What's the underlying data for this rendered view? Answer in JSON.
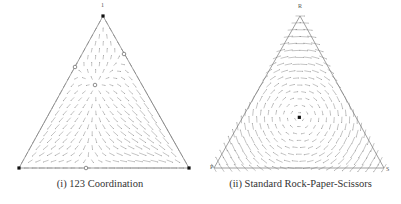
{
  "chart_data": [
    {
      "type": "vector-field-simplex",
      "title": "(i) 123 Coordination",
      "vertices": [
        "1",
        "2",
        "3"
      ],
      "vertex_labels_visible": [
        "1"
      ],
      "stable_points": [
        {
          "label": "vertex-top",
          "type": "filled"
        },
        {
          "label": "vertex-bottom-left",
          "type": "filled"
        },
        {
          "label": "vertex-bottom-right",
          "type": "filled"
        }
      ],
      "unstable_points": [
        {
          "label": "left-edge-mid",
          "type": "hollow"
        },
        {
          "label": "right-edge-mid",
          "type": "hollow"
        },
        {
          "label": "bottom-edge-mid",
          "type": "hollow"
        },
        {
          "label": "interior",
          "type": "hollow"
        }
      ],
      "grid": false
    },
    {
      "type": "vector-field-simplex",
      "title": "(ii) Standard Rock-Paper-Scissors",
      "vertices": [
        "R",
        "P",
        "S"
      ],
      "stable_points": [],
      "center_point": {
        "label": "interior-equilibrium",
        "type": "filled"
      },
      "dynamics": "cycling around center",
      "grid": false
    }
  ],
  "figure": {
    "left_caption": "(i) 123 Coordination",
    "right_caption": "(ii) Standard Rock-Paper-Scissors",
    "left_vertex_top": "1",
    "right_vertex_top": "R",
    "right_vertex_left": "P",
    "right_vertex_right": "S"
  }
}
